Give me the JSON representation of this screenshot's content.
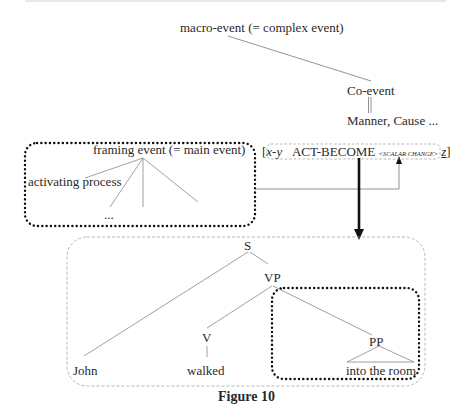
{
  "figure": {
    "caption": "Figure 10"
  },
  "conceptual_structure": {
    "root": "macro-event (= complex event)",
    "co_event": "Co-event",
    "co_event_types": "Manner, Cause ...",
    "framing_event": "framing event (= main event)",
    "activating_process": "activating process",
    "ellipsis": "..."
  },
  "semantic_formula": {
    "open_bracket": "[",
    "args": "x-y",
    "predicate": "ACT-BECOME",
    "subscript": "<SCALAR CHANGE>",
    "goal": "z",
    "close_bracket": "]"
  },
  "syntax_tree": {
    "s": "S",
    "vp": "VP",
    "v": "V",
    "pp": "PP",
    "subject": "John",
    "verb": "walked",
    "pp_phrase": "into the room"
  },
  "colors": {
    "line": "#777777",
    "dotted_box": "#111111",
    "dashed_box": "#999999",
    "arrow": "#111111"
  }
}
